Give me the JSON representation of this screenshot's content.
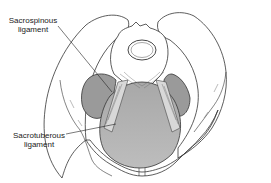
{
  "diagram": {
    "labels": [
      {
        "id": "sacrospinous",
        "line1": "Sacrospinous",
        "line2": "ligament"
      },
      {
        "id": "sacrotuberous",
        "line1": "Sacrotuberous",
        "line2": "ligament"
      }
    ],
    "colors": {
      "background": "#ffffff",
      "outline": "#333333",
      "bone_fill": "#ffffff",
      "muscle_fill_dark": "#9a9a9a",
      "muscle_fill_light": "#b8b8b8",
      "ligament_fill": "#d8d8d8",
      "label_text": "#222222"
    }
  }
}
